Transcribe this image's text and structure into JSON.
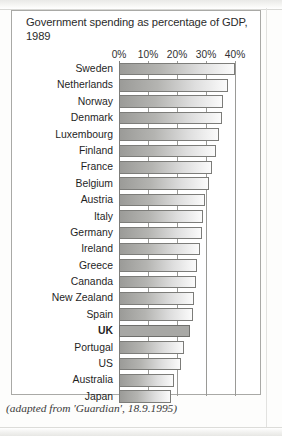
{
  "chart_data": {
    "type": "bar",
    "orientation": "horizontal",
    "title": "Government spending as percentage of GDP, 1989",
    "xlabel": "",
    "ylabel": "",
    "xlim": [
      0,
      40
    ],
    "grid": true,
    "legend": false,
    "tick_labels": [
      "0%",
      "10%",
      "20%",
      "30%",
      "40%"
    ],
    "tick_values": [
      0,
      10,
      20,
      30,
      40
    ],
    "categories": [
      "Sweden",
      "Netherlands",
      "Norway",
      "Denmark",
      "Luxembourg",
      "Finland",
      "France",
      "Belgium",
      "Austria",
      "Italy",
      "Germany",
      "Ireland",
      "Greece",
      "Cananda",
      "New Zealand",
      "Spain",
      "UK",
      "Portugal",
      "US",
      "Australia",
      "Japan"
    ],
    "values": [
      40,
      37.5,
      36,
      35.5,
      34.5,
      33.5,
      32,
      31,
      29.5,
      29,
      28.5,
      28,
      27,
      26.5,
      26,
      25.5,
      24.5,
      22.5,
      21.5,
      19,
      18
    ],
    "highlight_category": "UK",
    "annotations": [],
    "source_note": "(adapted from 'Guardian', 18.9.1995)"
  },
  "caption": "(adapted from 'Guardian', 18.9.1995)"
}
